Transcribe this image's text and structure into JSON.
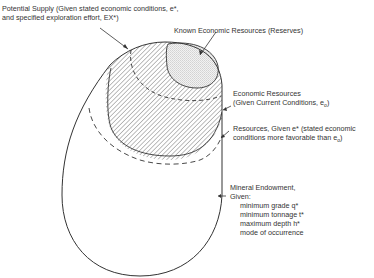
{
  "diagram": {
    "type": "resource-classification-nested-regions",
    "labels": {
      "potential_supply": {
        "line1": "Potential Supply (Given stated economic conditions, e*,",
        "line2": "and specified exploration effort, EX*)"
      },
      "known_economic_resources": "Known Economic Resources (Reserves)",
      "economic_resources": {
        "line1": "Economic Resources",
        "line2": "(Given Current Conditions, e",
        "line2_sub": "o",
        "line2_end": ")"
      },
      "resources_given": {
        "line1": "Resources, Given e* (stated economic",
        "line2": "conditions more favorable than e",
        "line2_sub": "o",
        "line2_end": ")"
      },
      "mineral_endowment": {
        "title": "Mineral Endowment,",
        "given": "Given:",
        "conditions": [
          "minimum grade q*",
          "minimum tonnage t*",
          "maximum depth h*",
          "mode of occurrence"
        ]
      }
    },
    "regions": [
      {
        "name": "Mineral Endowment",
        "style": "solid outline"
      },
      {
        "name": "Resources, Given e*",
        "style": "dashed boundary"
      },
      {
        "name": "Economic Resources",
        "style": "hatched fill"
      },
      {
        "name": "Potential Supply",
        "style": "dashed boundary within hatched"
      },
      {
        "name": "Known Economic Resources (Reserves)",
        "style": "stippled fill"
      }
    ]
  }
}
